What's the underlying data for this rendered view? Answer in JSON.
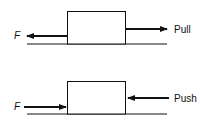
{
  "diagrams": [
    {
      "name": "pull",
      "friction_label": "F",
      "force_label": "Pull"
    },
    {
      "name": "push",
      "friction_label": "F",
      "force_label": "Push"
    }
  ],
  "colors": {
    "stroke": "#111111",
    "background": "#ffffff"
  }
}
